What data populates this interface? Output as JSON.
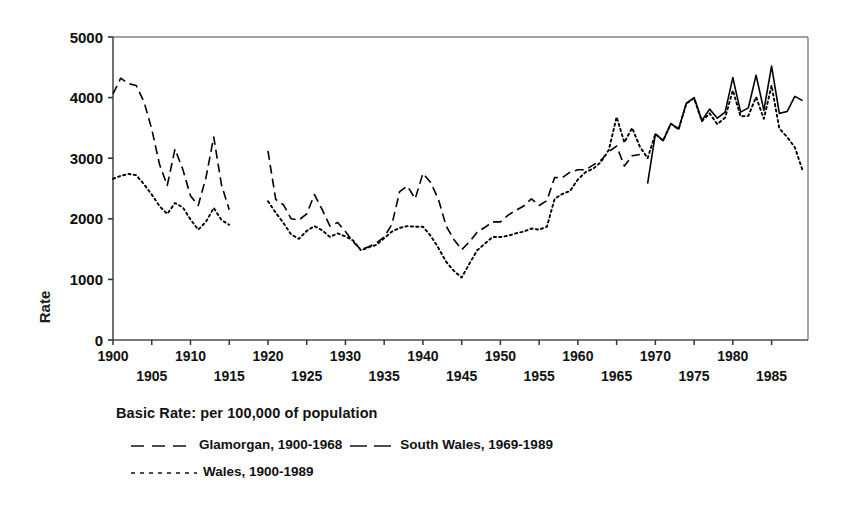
{
  "chart_data": {
    "type": "line",
    "title": "",
    "xlabel": "",
    "ylabel": "Rate",
    "xlim": [
      1900,
      1989.7
    ],
    "ylim": [
      0,
      5000
    ],
    "grid": false,
    "legend_position": "below-plot",
    "legend_title": "Basic Rate: per 100,000 of population",
    "y_ticks": [
      "0",
      "1000",
      "2000",
      "3000",
      "4000",
      "5000"
    ],
    "y_tick_values": [
      0,
      1000,
      2000,
      3000,
      4000,
      5000
    ],
    "x_ticks_upper": [
      "1900",
      "1910",
      "1920",
      "1930",
      "1940",
      "1950",
      "1960",
      "1970",
      "1980"
    ],
    "x_tick_upper_values": [
      1900,
      1910,
      1920,
      1930,
      1940,
      1950,
      1960,
      1970,
      1980
    ],
    "x_ticks_lower": [
      "1905",
      "1915",
      "1925",
      "1935",
      "1945",
      "1955",
      "1965",
      "1975",
      "1985"
    ],
    "x_tick_lower_values": [
      1905,
      1915,
      1925,
      1935,
      1945,
      1955,
      1965,
      1975,
      1985
    ],
    "series": [
      {
        "name": "Glamorgan, 1900-1968",
        "style": "dashed",
        "color": "#000000",
        "segments": [
          {
            "x": [
              1900,
              1901,
              1902,
              1903,
              1904,
              1905,
              1906,
              1907,
              1908,
              1909,
              1910,
              1911,
              1912,
              1913,
              1914,
              1915
            ],
            "y": [
              4060,
              4320,
              4230,
              4200,
              3930,
              3480,
              2900,
              2550,
              3150,
              2820,
              2380,
              2220,
              2680,
              3350,
              2560,
              2150
            ]
          },
          {
            "x": [
              1920,
              1921,
              1922,
              1923,
              1924,
              1925,
              1926,
              1927,
              1928,
              1929,
              1930,
              1931,
              1932,
              1933,
              1934,
              1935,
              1936,
              1937,
              1938,
              1939,
              1940,
              1941,
              1942,
              1943,
              1944,
              1945,
              1946,
              1947,
              1948,
              1949,
              1950,
              1951,
              1952,
              1953,
              1954,
              1955,
              1956,
              1957,
              1958,
              1959,
              1960,
              1961,
              1962,
              1963,
              1964,
              1965,
              1966,
              1967,
              1968
            ],
            "y": [
              3120,
              2320,
              2230,
              2000,
              1980,
              2080,
              2400,
              2150,
              1880,
              1940,
              1790,
              1620,
              1490,
              1540,
              1600,
              1700,
              1910,
              2450,
              2540,
              2330,
              2750,
              2600,
              2320,
              1880,
              1660,
              1490,
              1620,
              1780,
              1860,
              1950,
              1950,
              2060,
              2140,
              2210,
              2330,
              2220,
              2300,
              2680,
              2680,
              2770,
              2810,
              2810,
              2890,
              2970,
              3110,
              3200,
              2870,
              3040,
              3060
            ]
          }
        ]
      },
      {
        "name": "South Wales, 1969-1989",
        "style": "solid",
        "color": "#000000",
        "segments": [
          {
            "x": [
              1969,
              1970,
              1971,
              1972,
              1973,
              1974,
              1975,
              1976,
              1977,
              1978,
              1979,
              1980,
              1981,
              1982,
              1983,
              1984,
              1985,
              1986,
              1987,
              1988,
              1989
            ],
            "y": [
              2580,
              3400,
              3290,
              3570,
              3480,
              3910,
              4000,
              3620,
              3810,
              3660,
              3760,
              4330,
              3760,
              3830,
              4370,
              3790,
              4520,
              3740,
              3770,
              4020,
              3950
            ]
          }
        ]
      },
      {
        "name": "Wales, 1900-1989",
        "style": "dotted",
        "color": "#000000",
        "segments": [
          {
            "x": [
              1900,
              1901,
              1902,
              1903,
              1904,
              1905,
              1906,
              1907,
              1908,
              1909,
              1910,
              1911,
              1912,
              1913,
              1914,
              1915
            ],
            "y": [
              2660,
              2710,
              2740,
              2720,
              2570,
              2400,
              2210,
              2080,
              2260,
              2190,
              1990,
              1820,
              1950,
              2180,
              1980,
              1900
            ]
          },
          {
            "x": [
              1920,
              1921,
              1922,
              1923,
              1924,
              1925,
              1926,
              1927,
              1928,
              1929,
              1930,
              1931,
              1932,
              1933,
              1934,
              1935,
              1936,
              1937,
              1938,
              1939,
              1940,
              1941,
              1942,
              1943,
              1944,
              1945,
              1946,
              1947,
              1948,
              1949,
              1950,
              1951,
              1952,
              1953,
              1954,
              1955,
              1956,
              1957,
              1958,
              1959,
              1960,
              1961,
              1962,
              1963,
              1964,
              1965,
              1966,
              1967,
              1968,
              1969,
              1970,
              1971,
              1972,
              1973,
              1974,
              1975,
              1976,
              1977,
              1978,
              1979,
              1980,
              1981,
              1982,
              1983,
              1984,
              1985,
              1986,
              1987,
              1988,
              1989
            ],
            "y": [
              2290,
              2100,
              1930,
              1740,
              1670,
              1800,
              1880,
              1810,
              1700,
              1760,
              1710,
              1640,
              1480,
              1530,
              1570,
              1680,
              1790,
              1850,
              1880,
              1870,
              1870,
              1720,
              1520,
              1290,
              1140,
              1030,
              1260,
              1480,
              1590,
              1700,
              1700,
              1720,
              1760,
              1790,
              1840,
              1820,
              1870,
              2330,
              2410,
              2460,
              2650,
              2770,
              2830,
              2940,
              3140,
              3680,
              3260,
              3500,
              3190,
              3000,
              3400,
              3290,
              3570,
              3480,
              3900,
              3990,
              3610,
              3740,
              3560,
              3670,
              4120,
              3690,
              3700,
              4010,
              3650,
              4200,
              3490,
              3350,
              3180,
              2800
            ]
          }
        ]
      }
    ]
  },
  "legend": {
    "title": "Basic Rate: per 100,000 of population",
    "entries": [
      {
        "label": "Glamorgan, 1900-1968",
        "style": "dashed"
      },
      {
        "label": "South Wales, 1969-1989",
        "style": "solid-long-dash"
      },
      {
        "label": "Wales, 1900-1989",
        "style": "dotted"
      }
    ]
  },
  "axis": {
    "y_label": "Rate"
  }
}
